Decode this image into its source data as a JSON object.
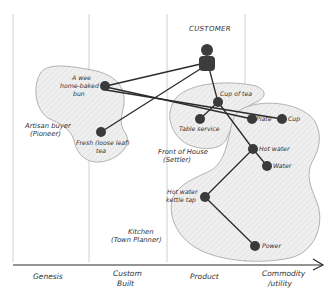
{
  "diagram": {
    "type": "wardley-map",
    "title": "CUSTOMER",
    "axis": {
      "stages": [
        "Genesis",
        "Custom Built",
        "Product",
        "Commodity /utility"
      ],
      "stage_lines": [
        "Custom",
        "Built",
        "Commodity",
        "/utility"
      ]
    },
    "regions": [
      {
        "name": "artisan",
        "label_line1": "Artisan buyer",
        "label_line2": "(Pioneer)"
      },
      {
        "name": "front-of-house",
        "label_line1": "Front of House",
        "label_line2": "(Settler)"
      },
      {
        "name": "kitchen",
        "label_line1": "Kitchen",
        "label_line2": "(Town Planner)"
      }
    ],
    "nodes": [
      {
        "id": "bun",
        "label_line1": "A wee",
        "label_line2": "home-baked",
        "label_line3": "bun"
      },
      {
        "id": "tea",
        "label_line1": "Fresh (loose leaf)",
        "label_line2": "tea"
      },
      {
        "id": "cup-of-tea",
        "label": "Cup of tea"
      },
      {
        "id": "table-service",
        "label": "Table service"
      },
      {
        "id": "plate",
        "label": "Plate"
      },
      {
        "id": "cup",
        "label": "Cup"
      },
      {
        "id": "hot-water",
        "label": "Hot water"
      },
      {
        "id": "water",
        "label": "Water"
      },
      {
        "id": "kettle",
        "label_line1": "Hot water",
        "label_line2": "kettle tap"
      },
      {
        "id": "power",
        "label": "Power"
      }
    ],
    "edges": [
      [
        "customer",
        "bun"
      ],
      [
        "customer",
        "tea"
      ],
      [
        "customer",
        "cup-of-tea"
      ],
      [
        "bun",
        "plate"
      ],
      [
        "bun",
        "cup"
      ],
      [
        "cup-of-tea",
        "table-service"
      ],
      [
        "cup-of-tea",
        "hot-water"
      ],
      [
        "hot-water",
        "water"
      ],
      [
        "hot-water",
        "kettle"
      ],
      [
        "kettle",
        "power"
      ]
    ],
    "colors": {
      "ink": "#2b2b2b",
      "node": "#3a3a3a",
      "region_fill": "#ececec",
      "region_stroke": "#9a9a9a",
      "grid": "#bdbdbd"
    }
  }
}
